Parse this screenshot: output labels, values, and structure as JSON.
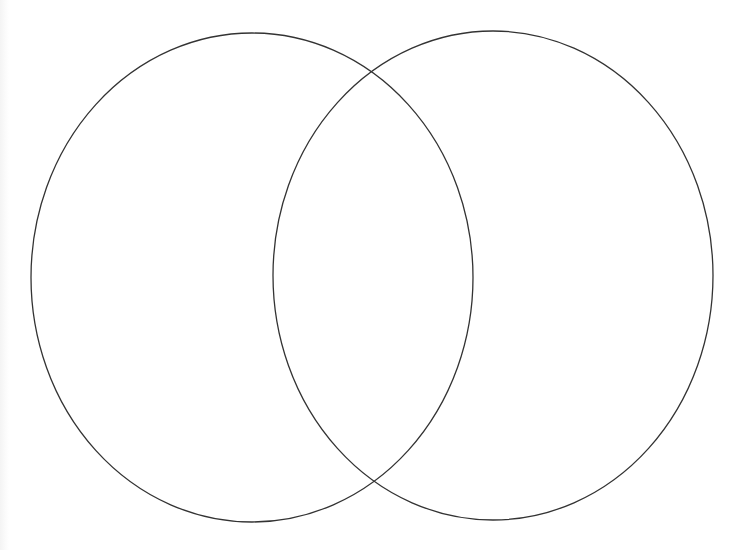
{
  "diagram": {
    "type": "venn",
    "set_count": 2,
    "background_color": "#ffffff",
    "stroke_color": "#333333",
    "canvas": {
      "width": 745,
      "height": 550
    },
    "sets": [
      {
        "id": "left",
        "label": "",
        "shape": "ellipse",
        "cx": 252,
        "cy": 277.5,
        "rx": 221,
        "ry": 244.5
      },
      {
        "id": "right",
        "label": "",
        "shape": "ellipse",
        "cx": 493,
        "cy": 275.5,
        "rx": 220,
        "ry": 244.5
      }
    ],
    "intersections": [
      {
        "position": "top",
        "x": 371,
        "y": 72
      },
      {
        "position": "bottom",
        "x": 374,
        "y": 482
      }
    ],
    "regions": {
      "left_only": "",
      "overlap": "",
      "right_only": ""
    }
  }
}
